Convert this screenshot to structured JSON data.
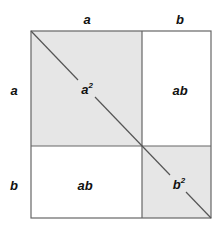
{
  "diagram": {
    "top_labels": [
      "a",
      "b"
    ],
    "side_labels": [
      "a",
      "b"
    ],
    "regions": [
      {
        "id": "a-squared",
        "label_base": "a",
        "label_exp": "2",
        "fill": "#e6e6e6"
      },
      {
        "id": "ab-top-right",
        "label": "ab",
        "fill": "#ffffff"
      },
      {
        "id": "ab-bottom-left",
        "label": "ab",
        "fill": "#ffffff"
      },
      {
        "id": "b-squared",
        "label_base": "b",
        "label_exp": "2",
        "fill": "#e6e6e6"
      }
    ],
    "colors": {
      "line": "#555555",
      "shade": "#e6e6e6"
    }
  }
}
